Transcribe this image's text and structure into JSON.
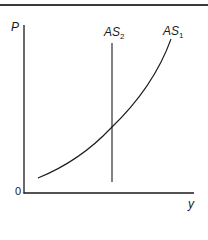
{
  "diagram": {
    "type": "aggregate supply diagram",
    "axes": {
      "y_label": "P",
      "x_label": "y",
      "origin_label": "0"
    },
    "curves": [
      {
        "name": "AS",
        "subscript": "1",
        "shape": "upward-sloping convex curve"
      },
      {
        "name": "AS",
        "subscript": "2",
        "shape": "vertical line"
      }
    ]
  }
}
